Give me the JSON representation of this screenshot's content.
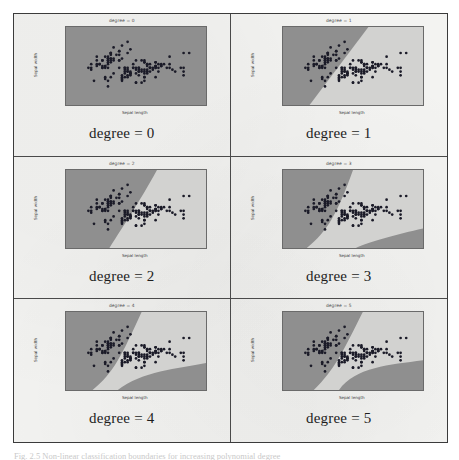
{
  "figure": {
    "caption": "Fig. 2.5 Non-linear classification boundaries for increasing polynomial degree",
    "frame_color": "#3b3b3b",
    "paper_color": "#f3f3f1"
  },
  "colors": {
    "region_class_a": "#8f8f8f",
    "region_class_b": "#d2d2d0",
    "point_color": "#1b1b28",
    "axis_color": "#6a6a6a",
    "tick_text": "#3f3f3f"
  },
  "axes_common": {
    "xlabel": "Sepal length",
    "ylabel": "Sepal width",
    "xticks": [
      "4",
      "5",
      "6",
      "7",
      "8"
    ],
    "yticks": [
      "5.0",
      "4.5",
      "4.0",
      "3.5",
      "3.0",
      "2.5",
      "2.0",
      "1.5",
      "1.0"
    ],
    "xlim": [
      3.5,
      8.5
    ],
    "ylim": [
      1.0,
      5.2
    ]
  },
  "panels": [
    {
      "title": "degree = 0",
      "caption": "degree = 0",
      "degree": 0
    },
    {
      "title": "degree = 1",
      "caption": "degree = 1",
      "degree": 1
    },
    {
      "title": "degree = 2",
      "caption": "degree = 2",
      "degree": 2
    },
    {
      "title": "degree = 3",
      "caption": "degree = 3",
      "degree": 3
    },
    {
      "title": "degree = 4",
      "caption": "degree = 4",
      "degree": 4
    },
    {
      "title": "degree = 5",
      "caption": "degree = 5",
      "degree": 5
    }
  ],
  "chart_data": {
    "type": "scatter",
    "xlabel": "Sepal length",
    "ylabel": "Sepal width",
    "xlim": [
      3.5,
      8.5
    ],
    "ylim": [
      1.0,
      5.2
    ],
    "xticks": [
      4,
      5,
      6,
      7,
      8
    ],
    "yticks": [
      1.0,
      1.5,
      2.0,
      2.5,
      3.0,
      3.5,
      4.0,
      4.5,
      5.0
    ],
    "grid": false,
    "legend": "none",
    "subplot_titles": [
      "degree = 0",
      "degree = 1",
      "degree = 2",
      "degree = 3",
      "degree = 4",
      "degree = 5"
    ],
    "points": [
      [
        5.1,
        3.5
      ],
      [
        4.9,
        3.0
      ],
      [
        4.7,
        3.2
      ],
      [
        4.6,
        3.1
      ],
      [
        5.0,
        3.6
      ],
      [
        5.4,
        3.9
      ],
      [
        4.6,
        3.4
      ],
      [
        5.0,
        3.4
      ],
      [
        4.4,
        2.9
      ],
      [
        4.9,
        3.1
      ],
      [
        5.4,
        3.7
      ],
      [
        4.8,
        3.4
      ],
      [
        4.8,
        3.0
      ],
      [
        4.3,
        3.0
      ],
      [
        5.8,
        4.0
      ],
      [
        5.7,
        4.4
      ],
      [
        5.4,
        3.9
      ],
      [
        5.1,
        3.5
      ],
      [
        5.7,
        3.8
      ],
      [
        5.1,
        3.8
      ],
      [
        5.4,
        3.4
      ],
      [
        5.1,
        3.7
      ],
      [
        4.6,
        3.6
      ],
      [
        5.1,
        3.3
      ],
      [
        4.8,
        3.4
      ],
      [
        5.0,
        3.0
      ],
      [
        5.0,
        3.4
      ],
      [
        5.2,
        3.5
      ],
      [
        5.2,
        3.4
      ],
      [
        4.7,
        3.2
      ],
      [
        4.8,
        3.1
      ],
      [
        5.4,
        3.4
      ],
      [
        5.2,
        4.1
      ],
      [
        5.5,
        4.2
      ],
      [
        4.9,
        3.1
      ],
      [
        5.0,
        3.2
      ],
      [
        5.5,
        3.5
      ],
      [
        4.9,
        3.6
      ],
      [
        4.4,
        3.0
      ],
      [
        5.1,
        3.4
      ],
      [
        5.0,
        3.5
      ],
      [
        4.5,
        2.3
      ],
      [
        4.4,
        3.2
      ],
      [
        5.0,
        3.5
      ],
      [
        5.1,
        3.8
      ],
      [
        4.8,
        3.0
      ],
      [
        5.1,
        3.8
      ],
      [
        4.6,
        3.2
      ],
      [
        5.3,
        3.7
      ],
      [
        5.0,
        3.3
      ],
      [
        7.0,
        3.2
      ],
      [
        6.4,
        3.2
      ],
      [
        6.9,
        3.1
      ],
      [
        5.5,
        2.3
      ],
      [
        6.5,
        2.8
      ],
      [
        5.7,
        2.8
      ],
      [
        6.3,
        3.3
      ],
      [
        4.9,
        2.4
      ],
      [
        6.6,
        2.9
      ],
      [
        5.2,
        2.7
      ],
      [
        5.0,
        2.0
      ],
      [
        5.9,
        3.0
      ],
      [
        6.0,
        2.2
      ],
      [
        6.1,
        2.9
      ],
      [
        5.6,
        2.9
      ],
      [
        6.7,
        3.1
      ],
      [
        5.6,
        3.0
      ],
      [
        5.8,
        2.7
      ],
      [
        6.2,
        2.2
      ],
      [
        5.6,
        2.5
      ],
      [
        5.9,
        3.2
      ],
      [
        6.1,
        2.8
      ],
      [
        6.3,
        2.5
      ],
      [
        6.1,
        2.8
      ],
      [
        6.4,
        2.9
      ],
      [
        6.6,
        3.0
      ],
      [
        6.8,
        2.8
      ],
      [
        6.7,
        3.0
      ],
      [
        6.0,
        2.9
      ],
      [
        5.7,
        2.6
      ],
      [
        5.5,
        2.4
      ],
      [
        5.5,
        2.4
      ],
      [
        5.8,
        2.7
      ],
      [
        6.0,
        2.7
      ],
      [
        5.4,
        3.0
      ],
      [
        6.0,
        3.4
      ],
      [
        6.7,
        3.1
      ],
      [
        6.3,
        2.3
      ],
      [
        5.6,
        3.0
      ],
      [
        5.5,
        2.5
      ],
      [
        5.5,
        2.6
      ],
      [
        6.1,
        3.0
      ],
      [
        5.8,
        2.6
      ],
      [
        5.0,
        2.3
      ],
      [
        5.6,
        2.7
      ],
      [
        5.7,
        3.0
      ],
      [
        5.7,
        2.9
      ],
      [
        6.2,
        2.9
      ],
      [
        5.1,
        2.5
      ],
      [
        5.7,
        2.8
      ],
      [
        6.3,
        3.3
      ],
      [
        5.8,
        2.7
      ],
      [
        7.1,
        3.0
      ],
      [
        6.3,
        2.9
      ],
      [
        6.5,
        3.0
      ],
      [
        7.6,
        3.0
      ],
      [
        4.9,
        2.5
      ],
      [
        7.3,
        2.9
      ],
      [
        6.7,
        2.5
      ],
      [
        7.2,
        3.6
      ],
      [
        6.5,
        3.2
      ],
      [
        6.4,
        2.7
      ],
      [
        6.8,
        3.0
      ],
      [
        5.7,
        2.5
      ],
      [
        5.8,
        2.8
      ],
      [
        6.4,
        3.2
      ],
      [
        6.5,
        3.0
      ],
      [
        7.7,
        3.8
      ],
      [
        7.7,
        2.6
      ],
      [
        6.0,
        2.2
      ],
      [
        6.9,
        3.2
      ],
      [
        5.6,
        2.8
      ],
      [
        7.7,
        2.8
      ],
      [
        6.3,
        2.7
      ],
      [
        6.7,
        3.3
      ],
      [
        7.2,
        3.2
      ],
      [
        6.2,
        2.8
      ],
      [
        6.1,
        3.0
      ],
      [
        6.4,
        2.8
      ],
      [
        7.2,
        3.0
      ],
      [
        7.4,
        2.8
      ],
      [
        7.9,
        3.8
      ],
      [
        6.4,
        2.8
      ],
      [
        6.3,
        2.8
      ],
      [
        6.1,
        2.6
      ],
      [
        7.7,
        3.0
      ],
      [
        6.3,
        3.4
      ],
      [
        6.4,
        3.1
      ],
      [
        6.0,
        3.0
      ],
      [
        6.9,
        3.1
      ],
      [
        6.7,
        3.1
      ],
      [
        6.9,
        3.1
      ],
      [
        5.8,
        2.7
      ],
      [
        6.8,
        3.2
      ],
      [
        6.7,
        3.3
      ],
      [
        6.7,
        3.0
      ],
      [
        6.3,
        2.5
      ],
      [
        6.5,
        3.0
      ],
      [
        6.2,
        3.4
      ],
      [
        5.9,
        3.0
      ]
    ],
    "boundaries": {
      "0": "none",
      "1": "linear",
      "2": "quadratic",
      "3": "cubic",
      "4": "quartic",
      "5": "quintic"
    }
  }
}
